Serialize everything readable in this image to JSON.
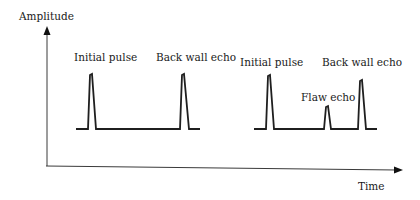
{
  "diagram": {
    "axes": {
      "y_label": "Amplitude",
      "x_label": "Time"
    },
    "left_trace": {
      "labels": {
        "initial_pulse": "Initial pulse",
        "back_wall_echo": "Back wall echo"
      }
    },
    "right_trace": {
      "labels": {
        "initial_pulse": "Initial pulse",
        "flaw_echo": "Flaw echo",
        "back_wall_echo": "Back wall echo"
      }
    },
    "colors": {
      "line": "#1f1f1f",
      "axis": "#3a3a3a",
      "background": "#ffffff"
    }
  }
}
